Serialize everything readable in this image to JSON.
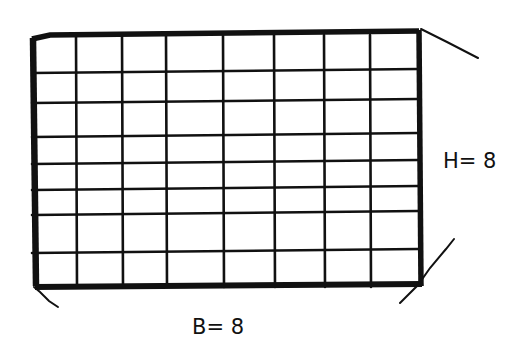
{
  "diagram": {
    "type": "grid-rectangle",
    "labels": {
      "height": "H= 8",
      "base": "B= 8"
    },
    "grid": {
      "columns": 8,
      "rows": 8,
      "vertical_lines_x": [
        32,
        76,
        122,
        166,
        223,
        274,
        324,
        370,
        418
      ],
      "horizontal_lines_y": [
        37,
        71,
        101,
        135,
        162,
        188,
        213,
        251,
        287
      ]
    },
    "colors": {
      "ink": "#111111",
      "paper": "#ffffff"
    }
  }
}
